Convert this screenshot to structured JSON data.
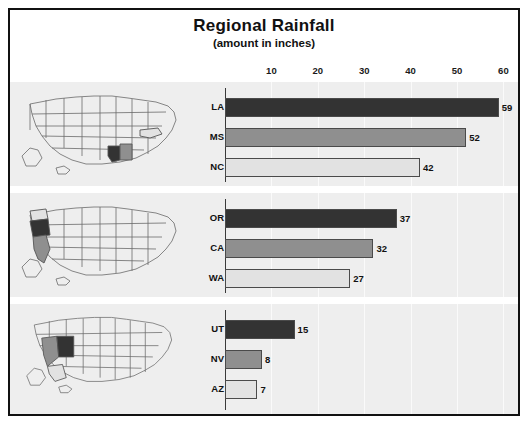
{
  "chart_data": {
    "type": "bar",
    "title": "Regional Rainfall",
    "subtitle": "(amount in inches)",
    "xlabel": "",
    "ylabel": "",
    "orientation": "horizontal",
    "xlim": [
      0,
      62
    ],
    "ticks": [
      10,
      20,
      30,
      40,
      50,
      60
    ],
    "grid": true,
    "legend": "none",
    "units": "inches",
    "panels": [
      {
        "name": "south",
        "map_alt": "United States map with Louisiana, Mississippi and North Carolina highlighted",
        "categories": [
          "LA",
          "MS",
          "NC"
        ],
        "values": [
          59,
          52,
          42
        ],
        "shades": [
          "dark",
          "medium",
          "light"
        ]
      },
      {
        "name": "west-coast",
        "map_alt": "United States map with Oregon, California and Washington highlighted",
        "categories": [
          "OR",
          "CA",
          "WA"
        ],
        "values": [
          37,
          32,
          27
        ],
        "shades": [
          "dark",
          "medium",
          "light"
        ]
      },
      {
        "name": "southwest",
        "map_alt": "United States map with Utah, Nevada and Arizona highlighted",
        "categories": [
          "UT",
          "NV",
          "AZ"
        ],
        "values": [
          15,
          8,
          7
        ],
        "shades": [
          "dark",
          "medium",
          "light"
        ]
      }
    ]
  },
  "colors": {
    "dark": "#333333",
    "medium": "#8f8f8f",
    "light": "#e2e2e2",
    "panel_background": "#eeeeee",
    "frame_border": "#111111"
  }
}
